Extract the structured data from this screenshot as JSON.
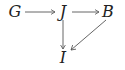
{
  "diagram": {
    "type": "commutative-diagram",
    "nodes": [
      {
        "id": "G",
        "label": "G",
        "x": 15,
        "y": 12
      },
      {
        "id": "J",
        "label": "J",
        "x": 63,
        "y": 12
      },
      {
        "id": "B",
        "label": "B",
        "x": 108,
        "y": 12
      },
      {
        "id": "I",
        "label": "I",
        "x": 63,
        "y": 58
      }
    ],
    "edges": [
      {
        "from": "G",
        "to": "J",
        "direction": "right"
      },
      {
        "from": "J",
        "to": "B",
        "direction": "right"
      },
      {
        "from": "J",
        "to": "I",
        "direction": "down"
      },
      {
        "from": "B",
        "to": "I",
        "direction": "down-left"
      }
    ],
    "colors": {
      "text": "#222222",
      "arrow": "#555555"
    }
  }
}
